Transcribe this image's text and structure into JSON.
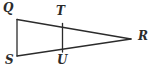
{
  "figure": {
    "type": "geometry-diagram",
    "background_color": "#ffffff",
    "stroke_color": "#2b2b2b",
    "stroke_width": 1.3,
    "width": 152,
    "height": 69
  },
  "points": {
    "Q": {
      "label": "Q",
      "x": 17,
      "y": 19.5,
      "label_x": 3,
      "label_y": 2
    },
    "S": {
      "label": "S",
      "x": 17,
      "y": 56,
      "label_x": 5,
      "label_y": 54
    },
    "T": {
      "label": "T",
      "x": 62.5,
      "y": 23.5,
      "label_x": 56,
      "label_y": 5
    },
    "U": {
      "label": "U",
      "x": 62.5,
      "y": 52,
      "label_x": 57,
      "label_y": 54
    },
    "R": {
      "label": "R",
      "x": 131,
      "y": 39,
      "label_x": 138,
      "label_y": 30
    }
  },
  "segments": [
    {
      "name": "QS",
      "from": "Q",
      "to": "S"
    },
    {
      "name": "QR",
      "from": "Q",
      "to": "R"
    },
    {
      "name": "SR",
      "from": "S",
      "to": "R"
    },
    {
      "name": "TU",
      "from": "T",
      "to": "U"
    }
  ]
}
